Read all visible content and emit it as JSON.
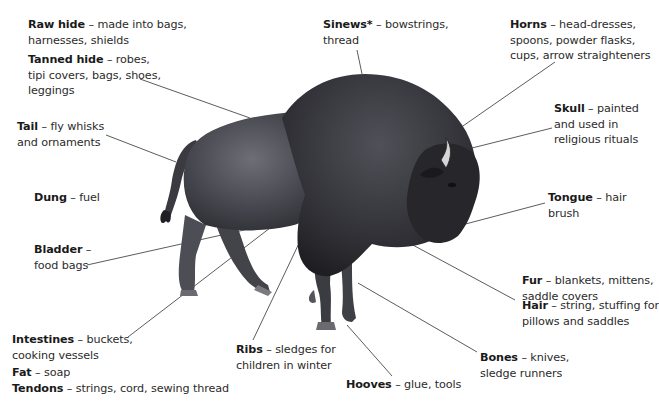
{
  "diagram": {
    "labels": [
      {
        "term": "Raw hide",
        "sep": " – ",
        "desc": [
          "made into bags,",
          "harnesses, shields"
        ]
      },
      {
        "term": "Tanned hide",
        "sep": " – ",
        "desc": [
          "robes,",
          "tipi covers, bags, shoes,",
          "leggings"
        ]
      },
      {
        "term": "Sinews*",
        "sep": " – ",
        "desc": [
          "bowstrings,",
          "thread"
        ]
      },
      {
        "term": "Horns",
        "sep": " – ",
        "desc": [
          "head-dresses,",
          "spoons, powder flasks,",
          "cups, arrow straighteners"
        ]
      },
      {
        "term": "Skull",
        "sep": " – ",
        "desc": [
          "painted",
          "and used in",
          "religious rituals"
        ]
      },
      {
        "term": "Tail",
        "sep": " – ",
        "desc": [
          "fly whisks",
          "and ornaments"
        ]
      },
      {
        "term": "Dung",
        "sep": " – ",
        "desc": [
          "fuel"
        ]
      },
      {
        "term": "Tongue",
        "sep": " – ",
        "desc": [
          "hair",
          "brush"
        ]
      },
      {
        "term": "Bladder",
        "sep": " – ",
        "desc": [
          "",
          "food bags"
        ]
      },
      {
        "term": "Fur",
        "sep": " – ",
        "desc": [
          "blankets, mittens,",
          "saddle covers"
        ]
      },
      {
        "term": "Hair",
        "sep": " – ",
        "desc": [
          "string, stuffing for",
          "pillows and saddles"
        ]
      },
      {
        "term": "Intestines",
        "sep": " – ",
        "desc": [
          "buckets,",
          "cooking vessels"
        ]
      },
      {
        "term": "Bones",
        "sep": " – ",
        "desc": [
          "knives,",
          "sledge runners"
        ]
      },
      {
        "term": "Fat",
        "sep": " – ",
        "desc": [
          "soap"
        ]
      },
      {
        "term": "Tendons",
        "sep": " – ",
        "desc": [
          "strings, cord, sewing thread"
        ]
      },
      {
        "term": "Ribs",
        "sep": " – ",
        "desc": [
          "sledges for",
          "children in winter"
        ]
      },
      {
        "term": "Hooves",
        "sep": " – ",
        "desc": [
          "glue, tools"
        ]
      }
    ],
    "colors": {
      "text": "#2b2b2b",
      "leader": "#444444",
      "bison_dark": "#2e2e33",
      "bison_mid": "#4a4a52",
      "bison_light": "#6c6c74"
    }
  }
}
